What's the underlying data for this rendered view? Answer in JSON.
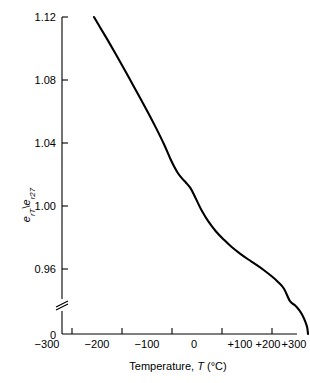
{
  "figure": {
    "background_color": "#ffffff",
    "ink_color": "#000000"
  },
  "axes": {
    "y_title_parts": {
      "e1": "e",
      "sub1": "rT",
      "slash": "\\",
      "e2": "e",
      "sub2": "r27"
    },
    "y_title_plain": "e rT \\ e r27",
    "x_title_parts": {
      "word": "Temperature,",
      "symbol": "T",
      "units": "(°C)"
    },
    "x_title_plain": "Temperature, T (°C)",
    "y_ticks": [
      "1.12",
      "1.08",
      "1.04",
      "1.00",
      "0.96",
      "0"
    ],
    "x_ticks": [
      "−300",
      "−200",
      "−100",
      "0",
      "+100",
      "+200",
      "+300"
    ],
    "axis_break": "true",
    "axis_break_note": "y-axis broken between 0.96 and 0"
  },
  "chart_data": {
    "type": "line",
    "title": "",
    "xlabel": "Temperature, T (°C)",
    "ylabel": "e rT / e r27",
    "xlim": [
      -300,
      300
    ],
    "ylim": [
      0.94,
      1.12
    ],
    "grid": "off",
    "legend": "none",
    "y_axis_break": [
      0.0,
      0.945
    ],
    "x_ticks_values": [
      -300,
      -200,
      -100,
      0,
      100,
      200,
      300
    ],
    "y_ticks_values": [
      1.12,
      1.08,
      1.04,
      1.0,
      0.96,
      0.0
    ],
    "series": [
      {
        "name": "relative permittivity ratio",
        "x": [
          -245,
          -230,
          -210,
          -190,
          -170,
          -150,
          -130,
          -110,
          -90,
          -70,
          -55,
          -45,
          -35,
          -25,
          -15,
          -5,
          5,
          15,
          25,
          40,
          60,
          80,
          100,
          120,
          140,
          160,
          180,
          200,
          215,
          230,
          245,
          258,
          268,
          276,
          283,
          288,
          290
        ],
        "y": [
          1.12,
          1.1135,
          1.105,
          1.0962,
          1.0872,
          1.078,
          1.0688,
          1.0594,
          1.0496,
          1.0392,
          1.0305,
          1.0252,
          1.0208,
          1.0175,
          1.0148,
          1.0118,
          1.0072,
          1.0018,
          0.9968,
          0.9905,
          0.9838,
          0.9785,
          0.9738,
          0.9698,
          0.9662,
          0.9628,
          0.9592,
          0.9552,
          0.9518,
          0.9475,
          0.9418,
          0.9355,
          0.9288,
          0.9215,
          0.9125,
          0.9035,
          0.894
        ]
      }
    ]
  }
}
